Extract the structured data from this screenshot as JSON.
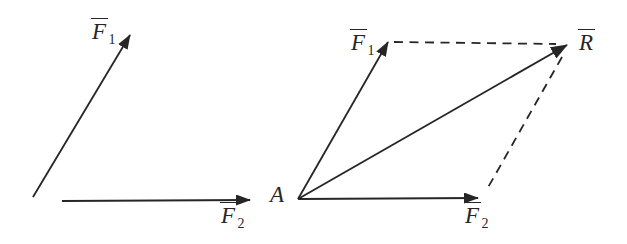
{
  "figure": {
    "background_color": "#ffffff",
    "line_color": "#262626"
  },
  "labels": {
    "f1": {
      "base": "F",
      "sub": "1",
      "overbar": true
    },
    "f2": {
      "base": "F",
      "sub": "2",
      "overbar": true
    },
    "r": {
      "base": "R",
      "sub": "",
      "overbar": true
    },
    "a": {
      "base": "A",
      "overbar": false
    }
  },
  "left_diagram": {
    "vectors": [
      {
        "label": "F1",
        "style": "solid",
        "direction": "up-right"
      },
      {
        "label": "F2",
        "style": "solid",
        "direction": "right"
      }
    ]
  },
  "right_diagram": {
    "origin_label": "A",
    "vectors": [
      {
        "label": "F1",
        "style": "solid",
        "direction": "up-right"
      },
      {
        "label": "F2",
        "style": "solid",
        "direction": "right"
      },
      {
        "label": "R",
        "style": "solid",
        "direction": "diagonal-resultant"
      }
    ],
    "dashed_construction_lines": 2
  }
}
